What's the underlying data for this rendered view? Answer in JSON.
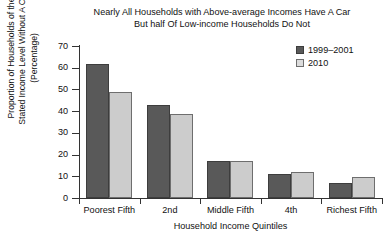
{
  "chart_data": {
    "type": "bar",
    "title": "Nearly All Households with Above-average Incomes Have A Car But half Of Low-income Households Do Not",
    "title_lines": [
      "Nearly All Households with Above-average Incomes Have A Car",
      "But half Of Low-income Households Do Not"
    ],
    "xlabel": "Household Income Quintiles",
    "ylabel": "Proportion of Households of the Stated Income Level Without A Car (Percentage)",
    "ylabel_lines": [
      "Proportion of Households of the",
      "Stated Income Level Without A Car",
      "(Percentage)"
    ],
    "categories": [
      "Poorest Fifth",
      "2nd",
      "Middle Fifth",
      "4th",
      "Richest Fifth"
    ],
    "series": [
      {
        "name": "1999–2001",
        "color": "#595959",
        "values": [
          61.5,
          43.0,
          17.0,
          11.0,
          7.0
        ]
      },
      {
        "name": "2010",
        "color": "#cccccc",
        "values": [
          49.0,
          38.5,
          17.0,
          12.0,
          9.5
        ]
      }
    ],
    "ylim": [
      0,
      70
    ],
    "ytick_values": [
      0,
      10,
      20,
      30,
      40,
      50,
      60,
      70
    ],
    "ytick_labels": [
      "0",
      "10",
      "20",
      "30",
      "40",
      "50",
      "60",
      "70"
    ],
    "grid": false,
    "legend_position": "top-right"
  },
  "legend": {
    "entries": [
      {
        "label": "1999–2001"
      },
      {
        "label": "2010"
      }
    ]
  }
}
